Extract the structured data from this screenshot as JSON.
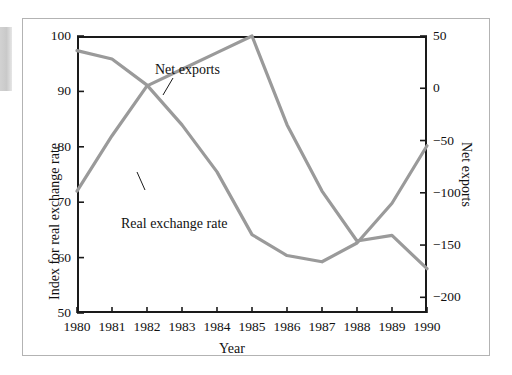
{
  "figure": {
    "x_axis_title": "Year",
    "y_axis_left_title": "Index for real exchange rate",
    "y_axis_right_title": "Net exports"
  },
  "labels": {
    "net_exports": "Net exports",
    "real_exchange_rate": "Real exchange rate"
  },
  "axes": {
    "left_ticks": [
      "50",
      "60",
      "70",
      "80",
      "90",
      "100"
    ],
    "right_ticks": [
      "50",
      "0",
      "-50",
      "-100",
      "-150",
      "-200"
    ],
    "x_ticks": [
      "1980",
      "1981",
      "1982",
      "1983",
      "1984",
      "1985",
      "1986",
      "1987",
      "1988",
      "1989",
      "1990"
    ]
  },
  "colors": {
    "series_line": "#9a9a9a",
    "axis": "#1a1a1a",
    "frame": "#b3b3b3",
    "text": "#111111"
  },
  "chart_data": {
    "type": "line",
    "title": "",
    "subtitle": "",
    "xlabel": "Year",
    "ylabel": "Index for real exchange rate",
    "ylabel_right": "Net exports",
    "grid": false,
    "legend": "inline-annotations",
    "x": [
      1980,
      1981,
      1982,
      1983,
      1984,
      1985,
      1986,
      1987,
      1988,
      1989,
      1990
    ],
    "xlim": [
      1980,
      1990
    ],
    "ylim_left": [
      50,
      100
    ],
    "ylim_right": [
      -215,
      50
    ],
    "series": [
      {
        "name": "Real exchange rate",
        "axis": "left",
        "color": "#9a9a9a",
        "values": [
          72,
          82,
          91,
          94,
          97,
          100,
          84,
          72,
          63,
          64,
          58
        ]
      },
      {
        "name": "Net exports",
        "axis": "right",
        "color": "#9a9a9a",
        "values": [
          36,
          28,
          3,
          -35,
          -80,
          -140,
          -160,
          -166,
          -148,
          -110,
          -55
        ]
      }
    ]
  }
}
